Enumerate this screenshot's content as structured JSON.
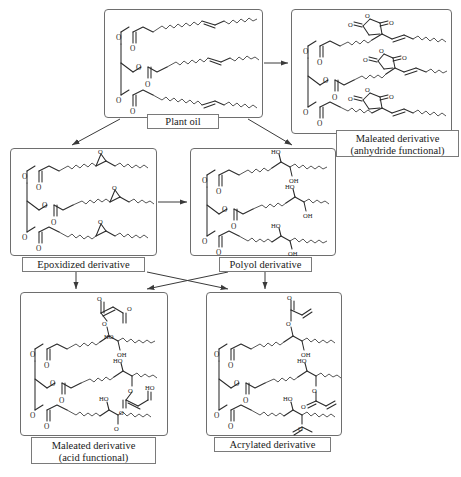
{
  "diagram": {
    "background": "#ffffff",
    "line_color": "#2b2b2b",
    "box_border_color": "#6e6e6e",
    "nodes": [
      {
        "id": "plant-oil",
        "label": "Plant oil",
        "label_lines": [
          "Plant oil"
        ],
        "chemistry": "triglyceride with three unsaturated fatty acid chains",
        "functional_group": "C=C alkene",
        "box": {
          "x": 104,
          "y": 9,
          "w": 159,
          "h": 109
        },
        "caption": {
          "x": 147,
          "y": 114,
          "w": 72,
          "h": 15
        }
      },
      {
        "id": "maleated-anhydride",
        "label": "Maleated derivative (anhydride functional)",
        "label_lines": [
          "Maleated derivative",
          "(anhydride functional)"
        ],
        "chemistry": "triglyceride with succinic anhydride rings",
        "functional_group": "cyclic anhydride",
        "box": {
          "x": 291,
          "y": 9,
          "w": 161,
          "h": 125
        },
        "caption": {
          "x": 336,
          "y": 130,
          "w": 123,
          "h": 27
        }
      },
      {
        "id": "epoxidized",
        "label": "Epoxidized derivative",
        "label_lines": [
          "Epoxidized derivative"
        ],
        "chemistry": "triglyceride with epoxide rings",
        "functional_group": "oxirane",
        "box": {
          "x": 10,
          "y": 148,
          "w": 147,
          "h": 108
        },
        "caption": {
          "x": 22,
          "y": 257,
          "w": 123,
          "h": 15
        }
      },
      {
        "id": "polyol",
        "label": "Polyol derivative",
        "label_lines": [
          "Polyol derivative"
        ],
        "chemistry": "triglyceride with vicinal diol groups",
        "functional_group": "hydroxyl",
        "box": {
          "x": 190,
          "y": 148,
          "w": 146,
          "h": 108
        },
        "caption": {
          "x": 219,
          "y": 257,
          "w": 93,
          "h": 15
        }
      },
      {
        "id": "maleated-acid",
        "label": "Maleated derivative (acid functional)",
        "label_lines": [
          "Maleated derivative",
          "(acid functional)"
        ],
        "chemistry": "polyol with maleate half-ester and free carboxylic acid",
        "functional_group": "carboxylic acid",
        "box": {
          "x": 20,
          "y": 292,
          "w": 148,
          "h": 144
        },
        "caption": {
          "x": 31,
          "y": 437,
          "w": 125,
          "h": 27
        }
      },
      {
        "id": "acrylated",
        "label": "Acrylated derivative",
        "label_lines": [
          "Acrylated derivative"
        ],
        "chemistry": "polyol with acrylate esters",
        "functional_group": "acrylate vinyl",
        "box": {
          "x": 206,
          "y": 292,
          "w": 136,
          "h": 144
        },
        "caption": {
          "x": 214,
          "y": 437,
          "w": 117,
          "h": 15
        }
      }
    ],
    "arrows": [
      {
        "from": "plant-oil",
        "to": "epoxidized",
        "style": "diagonal-down-left"
      },
      {
        "from": "plant-oil",
        "to": "polyol",
        "style": "diagonal-down-right"
      },
      {
        "from": "plant-oil",
        "to": "maleated-anhydride",
        "style": "horizontal-right"
      },
      {
        "from": "epoxidized",
        "to": "polyol",
        "style": "horizontal-right"
      },
      {
        "from": "epoxidized",
        "to": "maleated-acid",
        "style": "vertical-down"
      },
      {
        "from": "epoxidized",
        "to": "acrylated",
        "style": "diagonal-cross-down-right"
      },
      {
        "from": "polyol",
        "to": "maleated-acid",
        "style": "diagonal-cross-down-left"
      },
      {
        "from": "polyol",
        "to": "acrylated",
        "style": "vertical-down"
      }
    ],
    "atom_labels": {
      "oxygen": "O",
      "hydroxyl_right": "OH",
      "hydroxyl_left": "HO"
    }
  }
}
